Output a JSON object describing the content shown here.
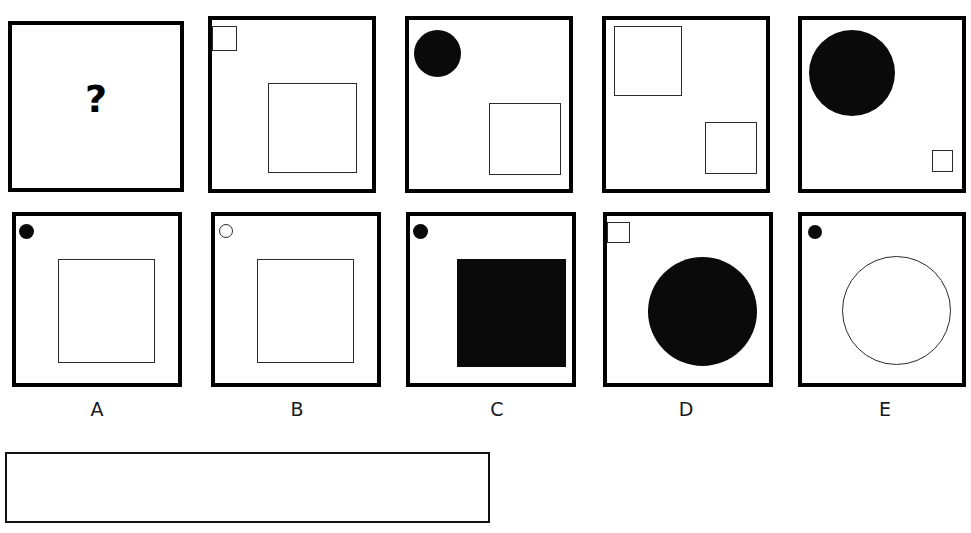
{
  "question": {
    "prompt_symbol": "?",
    "prompt_panel_name": "question-panel"
  },
  "top_row": [
    {
      "id": "question",
      "shapes": []
    },
    {
      "id": "context-2",
      "shapes": [
        {
          "kind": "square-outline",
          "label": "small-square-top-left"
        },
        {
          "kind": "square-outline",
          "label": "large-square-center-right"
        }
      ]
    },
    {
      "id": "context-3",
      "shapes": [
        {
          "kind": "circle-filled",
          "label": "filled-circle-top-left"
        },
        {
          "kind": "square-outline",
          "label": "square-bottom-right"
        }
      ]
    },
    {
      "id": "context-4",
      "shapes": [
        {
          "kind": "square-outline",
          "label": "large-square-top-left"
        },
        {
          "kind": "square-outline",
          "label": "small-square-bottom-right"
        }
      ]
    },
    {
      "id": "context-5",
      "shapes": [
        {
          "kind": "circle-filled",
          "label": "large-filled-circle-top-left"
        },
        {
          "kind": "square-outline",
          "label": "tiny-square-bottom-right"
        }
      ]
    }
  ],
  "options": [
    {
      "label": "A",
      "shapes": [
        {
          "kind": "circle-filled",
          "label": "small-filled-dot-top-left"
        },
        {
          "kind": "square-outline",
          "label": "large-square-outline"
        }
      ]
    },
    {
      "label": "B",
      "shapes": [
        {
          "kind": "circle-outline",
          "label": "small-outline-dot-top-left"
        },
        {
          "kind": "square-outline",
          "label": "large-square-outline"
        }
      ]
    },
    {
      "label": "C",
      "shapes": [
        {
          "kind": "circle-filled",
          "label": "small-filled-dot-top-left"
        },
        {
          "kind": "square-filled",
          "label": "large-square-filled"
        }
      ]
    },
    {
      "label": "D",
      "shapes": [
        {
          "kind": "square-outline",
          "label": "small-square-top-left"
        },
        {
          "kind": "circle-filled",
          "label": "large-filled-circle"
        }
      ]
    },
    {
      "label": "E",
      "shapes": [
        {
          "kind": "circle-filled",
          "label": "small-filled-dot-top-left"
        },
        {
          "kind": "circle-outline",
          "label": "large-outline-circle"
        }
      ]
    }
  ],
  "answer_box": {
    "value": "",
    "placeholder": ""
  },
  "colors": {
    "ink": "#000000",
    "fill": "#0a0a0a",
    "thin_line": "#2b2b2b",
    "background": "#ffffff"
  }
}
